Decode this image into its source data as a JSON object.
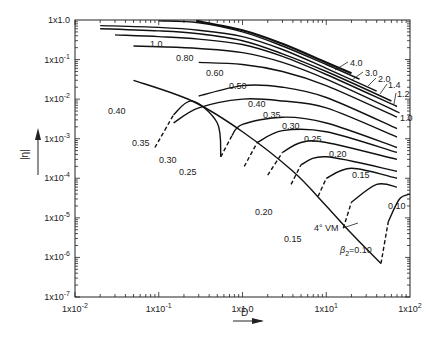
{
  "chart_data": {
    "type": "line",
    "title": "",
    "xlabel": "D",
    "ylabel": "|η|",
    "xscale": "log",
    "yscale": "log",
    "xlim": [
      0.01,
      100
    ],
    "ylim": [
      1e-07,
      1.0
    ],
    "grid": false,
    "x_ticks": [
      "1x10^-2",
      "1x10^-1",
      "1x1.0",
      "1x10^1",
      "1x10^2"
    ],
    "y_ticks": [
      "1x1.0",
      "1x10^-1",
      "1x10^-2",
      "1x10^-3",
      "1x10^-4",
      "1x10^-5",
      "1x10^-6",
      "1x10^-7"
    ],
    "legend": null,
    "annotations": [
      "4° VM",
      "β2 = 0.10"
    ],
    "series": [
      {
        "name": "4.0",
        "style": "solid",
        "points": [
          [
            0.28,
            0.95
          ],
          [
            1,
            0.55
          ],
          [
            3,
            0.25
          ],
          [
            10,
            0.085
          ],
          [
            20,
            0.045
          ]
        ]
      },
      {
        "name": "3.0",
        "style": "solid",
        "points": [
          [
            0.1,
            0.95
          ],
          [
            0.3,
            0.85
          ],
          [
            1,
            0.5
          ],
          [
            3,
            0.22
          ],
          [
            10,
            0.075
          ],
          [
            25,
            0.032
          ]
        ]
      },
      {
        "name": "2.0",
        "style": "solid",
        "points": [
          [
            0.02,
            0.72
          ],
          [
            0.1,
            0.65
          ],
          [
            0.3,
            0.55
          ],
          [
            1,
            0.38
          ],
          [
            3,
            0.18
          ],
          [
            10,
            0.06
          ],
          [
            40,
            0.016
          ]
        ]
      },
      {
        "name": "1.4",
        "style": "solid",
        "points": [
          [
            0.02,
            0.6
          ],
          [
            0.1,
            0.53
          ],
          [
            0.3,
            0.45
          ],
          [
            1,
            0.3
          ],
          [
            3,
            0.14
          ],
          [
            10,
            0.05
          ],
          [
            60,
            0.009
          ]
        ]
      },
      {
        "name": "1.2",
        "style": "solid",
        "points": [
          [
            0.03,
            0.42
          ],
          [
            0.1,
            0.38
          ],
          [
            0.3,
            0.33
          ],
          [
            1,
            0.24
          ],
          [
            3,
            0.12
          ],
          [
            10,
            0.042
          ],
          [
            70,
            0.0065
          ]
        ]
      },
      {
        "name": "1.0",
        "style": "solid",
        "points": [
          [
            0.05,
            0.22
          ],
          [
            0.1,
            0.21
          ],
          [
            0.3,
            0.19
          ],
          [
            1,
            0.15
          ],
          [
            3,
            0.085
          ],
          [
            10,
            0.032
          ],
          [
            75,
            0.0045
          ]
        ]
      },
      {
        "name": "0.80",
        "style": "solid",
        "points": [
          [
            0.3,
            0.085
          ],
          [
            1,
            0.075
          ],
          [
            3,
            0.05
          ],
          [
            10,
            0.022
          ],
          [
            70,
            0.0035
          ]
        ]
      },
      {
        "name": "0.60",
        "style": "solid",
        "points": [
          [
            0.3,
            0.012
          ],
          [
            1,
            0.022
          ],
          [
            3,
            0.02
          ],
          [
            10,
            0.011
          ],
          [
            70,
            0.0018
          ]
        ]
      },
      {
        "name": "0.50",
        "style": "solid",
        "points": [
          [
            0.15,
            0.0025
          ],
          [
            0.3,
            0.006
          ],
          [
            1,
            0.01
          ],
          [
            3,
            0.009
          ],
          [
            10,
            0.006
          ],
          [
            70,
            0.0011
          ]
        ]
      },
      {
        "name": "0.40",
        "style": "mixed",
        "points": [
          [
            0.55,
            0.00035
          ],
          [
            0.75,
            0.0012
          ],
          [
            1,
            0.0023
          ],
          [
            3,
            0.0035
          ],
          [
            10,
            0.0025
          ],
          [
            70,
            0.0006
          ]
        ]
      },
      {
        "name": "0.35",
        "style": "mixed",
        "points": [
          [
            1.05,
            0.0002
          ],
          [
            1.5,
            0.0008
          ],
          [
            3,
            0.0016
          ],
          [
            10,
            0.0015
          ],
          [
            70,
            0.00045
          ]
        ]
      },
      {
        "name": "0.30",
        "style": "mixed",
        "points": [
          [
            2.0,
            0.00012
          ],
          [
            3,
            0.00045
          ],
          [
            5,
            0.0008
          ],
          [
            10,
            0.0008
          ],
          [
            70,
            0.0003
          ]
        ]
      },
      {
        "name": "0.25",
        "style": "mixed",
        "points": [
          [
            3.8,
            7e-05
          ],
          [
            5,
            0.00022
          ],
          [
            10,
            0.00035
          ],
          [
            70,
            0.00015
          ]
        ]
      },
      {
        "name": "0.20",
        "style": "mixed",
        "points": [
          [
            8,
            3.5e-05
          ],
          [
            10,
            0.0001
          ],
          [
            20,
            0.00018
          ],
          [
            70,
            0.0001
          ]
        ]
      },
      {
        "name": "0.15",
        "style": "mixed",
        "points": [
          [
            16,
            5.5e-06
          ],
          [
            20,
            2.5e-05
          ],
          [
            40,
            7e-05
          ],
          [
            70,
            6e-05
          ]
        ]
      },
      {
        "name": "0.10",
        "style": "mixed",
        "points": [
          [
            45,
            7e-07
          ],
          [
            55,
            8e-06
          ],
          [
            75,
            3e-05
          ],
          [
            100,
            4e-05
          ]
        ]
      },
      {
        "name": "0.40 (left lobe)",
        "style": "mixed",
        "points": [
          [
            0.09,
            0.0006
          ],
          [
            0.15,
            0.004
          ],
          [
            0.25,
            0.009
          ],
          [
            0.5,
            0.0025
          ],
          [
            0.55,
            0.00035
          ]
        ]
      },
      {
        "name": "4° VM",
        "style": "solid",
        "points": [
          [
            0.05,
            0.03
          ],
          [
            0.25,
            0.009
          ],
          [
            1,
            0.0015
          ],
          [
            4,
            0.00015
          ],
          [
            10,
            2e-05
          ],
          [
            20,
            4e-06
          ],
          [
            45,
            7e-07
          ]
        ]
      }
    ]
  },
  "labels": {
    "y_axis_title": "|η|",
    "x_axis_title": "D",
    "vm_label": "4° VM",
    "beta_label": "β",
    "beta_sub": "2",
    "beta_value": "=0.10",
    "x_ticks": [
      {
        "base": "1x10",
        "exp": "-2"
      },
      {
        "base": "1x10",
        "exp": "-1"
      },
      {
        "base": "1x1.0",
        "exp": ""
      },
      {
        "base": "1x10",
        "exp": "1"
      },
      {
        "base": "1x10",
        "exp": "2"
      }
    ],
    "y_ticks": [
      {
        "base": "1x1.0",
        "exp": ""
      },
      {
        "base": "1x10",
        "exp": "-1"
      },
      {
        "base": "1x10",
        "exp": "-2"
      },
      {
        "base": "1x10",
        "exp": "-3"
      },
      {
        "base": "1x10",
        "exp": "-4"
      },
      {
        "base": "1x10",
        "exp": "-5"
      },
      {
        "base": "1x10",
        "exp": "-6"
      },
      {
        "base": "1x10",
        "exp": "-7"
      }
    ],
    "curve_labels": [
      {
        "text": "4.0",
        "x": 350,
        "y": 66
      },
      {
        "text": "3.0",
        "x": 365,
        "y": 76
      },
      {
        "text": "2.0",
        "x": 378,
        "y": 82
      },
      {
        "text": "1.4",
        "x": 388,
        "y": 88
      },
      {
        "text": "1.2",
        "x": 397,
        "y": 97
      },
      {
        "text": "1.0",
        "x": 400,
        "y": 121
      },
      {
        "text": "1.0",
        "x": 150,
        "y": 47
      },
      {
        "text": "0.80",
        "x": 176,
        "y": 61
      },
      {
        "text": "0.60",
        "x": 206,
        "y": 76
      },
      {
        "text": "0.50",
        "x": 229,
        "y": 89
      },
      {
        "text": "0.40",
        "x": 108,
        "y": 114
      },
      {
        "text": "0.40",
        "x": 248,
        "y": 107
      },
      {
        "text": "0.35",
        "x": 263,
        "y": 118
      },
      {
        "text": "0.30",
        "x": 282,
        "y": 129
      },
      {
        "text": "0.25",
        "x": 304,
        "y": 142
      },
      {
        "text": "0.20",
        "x": 329,
        "y": 157
      },
      {
        "text": "0.15",
        "x": 352,
        "y": 178
      },
      {
        "text": "0.10",
        "x": 388,
        "y": 209
      },
      {
        "text": "0.35",
        "x": 132,
        "y": 146
      },
      {
        "text": "0.30",
        "x": 159,
        "y": 163
      },
      {
        "text": "0.25",
        "x": 179,
        "y": 175
      },
      {
        "text": "0.20",
        "x": 255,
        "y": 215
      },
      {
        "text": "0.15",
        "x": 284,
        "y": 242
      }
    ]
  }
}
